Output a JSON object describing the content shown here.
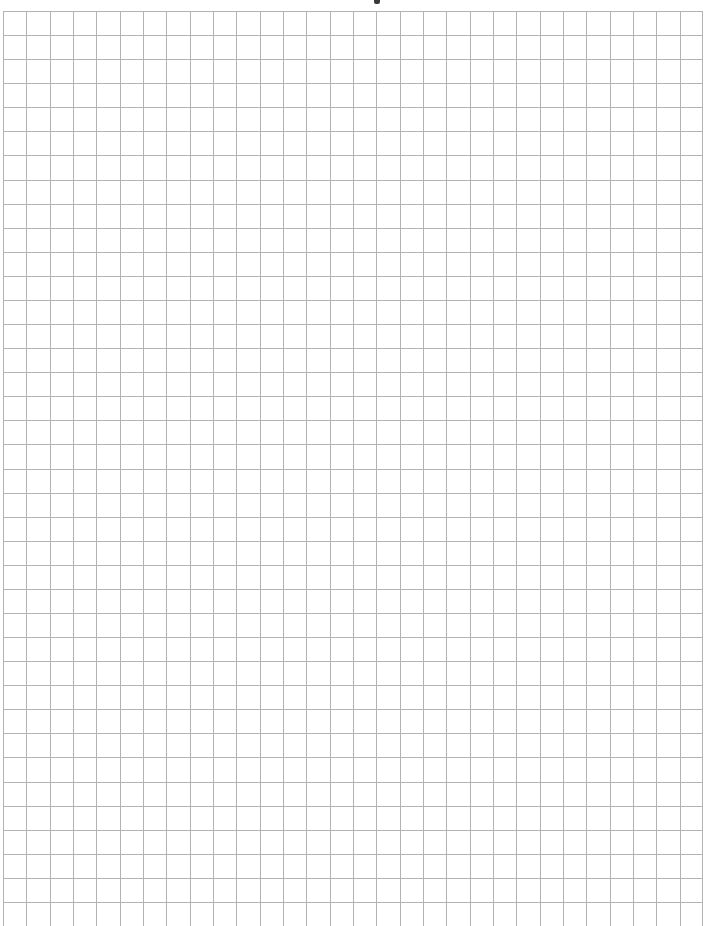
{
  "document": {
    "type": "graph-paper",
    "content": "",
    "grid": {
      "columns": 30,
      "visible_rows": 38,
      "origin_x": 3,
      "origin_y": 11,
      "right_edge_x": 703,
      "cell_width": 23.33,
      "cell_height": 24.08,
      "line_color": "#b3b3b3",
      "background_color": "#ffffff"
    },
    "top_fragment": {
      "description": "cut-off dark mark at top edge",
      "color": "#3a3a3a"
    }
  }
}
